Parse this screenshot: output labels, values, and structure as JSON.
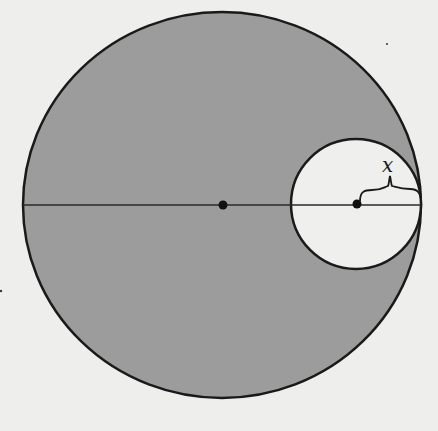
{
  "diagram": {
    "type": "geometry",
    "colors": {
      "background": "#eeeeec",
      "shaded_region": "#9c9c9c",
      "inner_circle_fill": "#efefed",
      "stroke": "#1a1a1a"
    },
    "large_circle": {
      "center": [
        222,
        205
      ],
      "rx": 199,
      "ry": 193,
      "shaded": true
    },
    "small_circle": {
      "center": [
        356,
        204
      ],
      "r": 65,
      "shaded": false,
      "tangent_point": [
        421,
        204
      ]
    },
    "diameter_line": {
      "from": [
        23,
        205
      ],
      "to": [
        421,
        205
      ]
    },
    "points": [
      {
        "name": "center-large",
        "at": [
          223,
          205
        ]
      },
      {
        "name": "center-small",
        "at": [
          357,
          204
        ]
      }
    ],
    "brace": {
      "from": [
        357,
        204
      ],
      "to": [
        421,
        204
      ],
      "label": "x"
    }
  }
}
